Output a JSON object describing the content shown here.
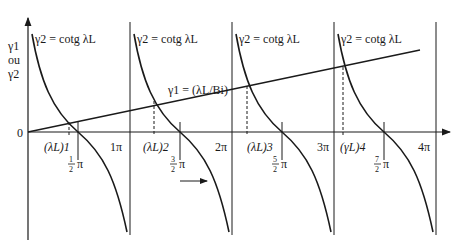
{
  "figure": {
    "y_axis_label": [
      "γ1",
      "ou",
      "γ2"
    ],
    "origin_label": "0",
    "line_label": "γ1 = (λL/Bi)",
    "curve_label": "γ2 = cotg λL",
    "pi_ticks": [
      "1π",
      "2π",
      "3π",
      "4π"
    ],
    "root_labels": [
      "(λL)1",
      "(λL)2",
      "(λL)3",
      "(γL)4"
    ],
    "half_pi_labels": [
      {
        "num": "1",
        "den": "2",
        "sym": "π"
      },
      {
        "num": "3",
        "den": "2",
        "sym": "π"
      },
      {
        "num": "5",
        "den": "2",
        "sym": "π"
      },
      {
        "num": "7",
        "den": "2",
        "sym": "π"
      }
    ]
  }
}
